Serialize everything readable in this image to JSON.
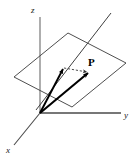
{
  "figure": {
    "width": 140,
    "height": 159,
    "background_color": "#ffffff",
    "axis_color": "#555555",
    "plane_color": "#3a3a3a",
    "vector_color": "#000000",
    "dashed_color": "#555555",
    "label_color": "#1a1a1a"
  },
  "axes": {
    "z": {
      "label": "z",
      "label_x": 31,
      "label_y": 13,
      "line": {
        "x1": 40,
        "y1": 17,
        "x2": 40,
        "y2": 113
      }
    },
    "y": {
      "label": "y",
      "label_x": 124,
      "label_y": 118,
      "line": {
        "x1": 40,
        "y1": 113,
        "x2": 121,
        "y2": 113
      }
    },
    "x": {
      "label": "x",
      "label_x": 6,
      "label_y": 153,
      "line": {
        "x1": 40,
        "y1": 113,
        "x2": 14,
        "y2": 145
      }
    }
  },
  "plane": {
    "name": "coordinate-plane-parallelogram",
    "points": "14,77 68,33 126,63 72,107"
  },
  "oblique_line": {
    "name": "oblique-axis-line",
    "x1": 36,
    "y1": 110,
    "x2": 111,
    "y2": 13
  },
  "vectors": [
    {
      "name": "component-vector",
      "x1": 40,
      "y1": 113,
      "x2": 63,
      "y2": 69
    },
    {
      "name": "position-vector-p",
      "x1": 40,
      "y1": 113,
      "x2": 88,
      "y2": 73
    }
  ],
  "dashed_connector": {
    "name": "dashed-projection-connector",
    "x1": 64,
    "y1": 68,
    "x2": 87,
    "y2": 72
  },
  "point": {
    "label": "P",
    "label_x": 88,
    "label_y": 66
  }
}
